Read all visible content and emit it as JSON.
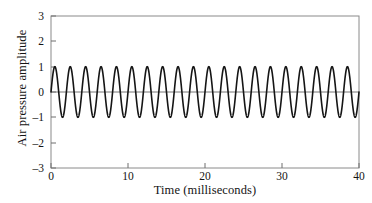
{
  "figure": {
    "background_color": "#ffffff",
    "line_color": "#151515",
    "axis_color": "#7d7d7d",
    "text_color": "#141414"
  },
  "chart_data": {
    "type": "line",
    "title": "",
    "subtitle": "",
    "xlabel": "Time (milliseconds)",
    "ylabel": "Air pressure amplitude",
    "xlim": [
      0,
      40
    ],
    "ylim": [
      -3,
      3
    ],
    "xticks": [
      0,
      10,
      20,
      30,
      40
    ],
    "xtick_labels": [
      "0",
      "10",
      "20",
      "30",
      "40"
    ],
    "yticks": [
      3,
      2,
      1,
      0,
      -1,
      -2,
      -3
    ],
    "ytick_labels": [
      "3",
      "2",
      "1",
      "0",
      "–1",
      "–2",
      "–3"
    ],
    "grid": false,
    "legend": null,
    "annotations": [],
    "series": [
      {
        "name": "Air pressure waveform",
        "waveform": "sine",
        "amplitude": 1.0,
        "frequency_hz": 500,
        "period_ms": 2.0,
        "cycles_shown": 20,
        "phase_deg": 0,
        "offset": 0,
        "x_start": 0,
        "x_end": 40,
        "x": [
          0,
          0.5,
          1,
          1.5,
          2,
          2.5,
          3,
          3.5,
          4,
          4.5,
          5,
          5.5,
          6,
          6.5,
          7,
          7.5,
          8,
          8.5,
          9,
          9.5,
          10,
          10.5,
          11,
          11.5,
          12,
          12.5,
          13,
          13.5,
          14,
          14.5,
          15,
          15.5,
          16,
          16.5,
          17,
          17.5,
          18,
          18.5,
          19,
          19.5,
          20,
          20.5,
          21,
          21.5,
          22,
          22.5,
          23,
          23.5,
          24,
          24.5,
          25,
          25.5,
          26,
          26.5,
          27,
          27.5,
          28,
          28.5,
          29,
          29.5,
          30,
          30.5,
          31,
          31.5,
          32,
          32.5,
          33,
          33.5,
          34,
          34.5,
          35,
          35.5,
          36,
          36.5,
          37,
          37.5,
          38,
          38.5,
          39,
          39.5,
          40
        ],
        "y": [
          0,
          1,
          0,
          -1,
          0,
          1,
          0,
          -1,
          0,
          1,
          0,
          -1,
          0,
          1,
          0,
          -1,
          0,
          1,
          0,
          -1,
          0,
          1,
          0,
          -1,
          0,
          1,
          0,
          -1,
          0,
          1,
          0,
          -1,
          0,
          1,
          0,
          -1,
          0,
          1,
          0,
          -1,
          0,
          1,
          0,
          -1,
          0,
          1,
          0,
          -1,
          0,
          1,
          0,
          -1,
          0,
          1,
          0,
          -1,
          0,
          1,
          0,
          -1,
          0,
          1,
          0,
          -1,
          0,
          1,
          0,
          -1,
          0,
          1,
          0,
          -1,
          0,
          1,
          0,
          -1,
          0,
          1,
          0,
          -1,
          0
        ]
      }
    ],
    "zero_line": true
  }
}
